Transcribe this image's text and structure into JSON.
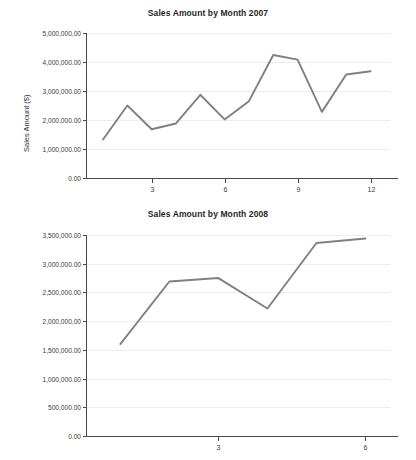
{
  "chart_data": [
    {
      "type": "line",
      "title": "Sales Amount by Month 2007",
      "xlabel": "",
      "ylabel": "Sales Amount ($)",
      "x": [
        1,
        2,
        3,
        4,
        5,
        6,
        7,
        8,
        9,
        10,
        11,
        12
      ],
      "values": [
        1330000,
        2500000,
        1680000,
        1880000,
        2870000,
        2020000,
        2650000,
        4240000,
        4080000,
        2280000,
        3570000,
        3680000
      ],
      "ylim": [
        0,
        5000000
      ],
      "xlim": [
        0.3,
        12.8
      ],
      "ytick_values": [
        0,
        1000000,
        2000000,
        3000000,
        4000000,
        5000000
      ],
      "ytick_labels": [
        "0.00",
        "1,000,000.00",
        "2,000,000.00",
        "3,000,000.00",
        "4,000,000.00",
        "5,000,000.00"
      ],
      "xtick_values": [
        3,
        6,
        9,
        12
      ],
      "xtick_labels": [
        "3",
        "6",
        "9",
        "12"
      ],
      "grid": true,
      "legend": "none",
      "line_color": "#808080"
    },
    {
      "type": "line",
      "title": "Sales Amount by Month 2008",
      "xlabel": "",
      "ylabel": "Sales Amount ($)",
      "x": [
        1,
        2,
        3,
        4,
        5,
        6
      ],
      "values": [
        1600000,
        2690000,
        2750000,
        2220000,
        3360000,
        3440000
      ],
      "ylim": [
        0,
        3500000
      ],
      "xlim": [
        0.3,
        6.5
      ],
      "ytick_values": [
        0,
        500000,
        1000000,
        1500000,
        2000000,
        2500000,
        3000000,
        3500000
      ],
      "ytick_labels": [
        "0.00",
        "500,000.00",
        "1,000,000.00",
        "1,500,000.00",
        "2,000,000.00",
        "2,500,000.00",
        "3,000,000.00",
        "3,500,000.00"
      ],
      "xtick_values": [
        3,
        6
      ],
      "xtick_labels": [
        "3",
        "6"
      ],
      "grid": true,
      "legend": "none",
      "line_color": "#808080"
    }
  ],
  "charts": {
    "first": {
      "title": "Sales Amount by Month 2007",
      "ylabel": "Sales Amount ($)"
    },
    "second": {
      "title": "Sales Amount by Month 2008",
      "ylabel": "Sales Amount ($)"
    }
  }
}
